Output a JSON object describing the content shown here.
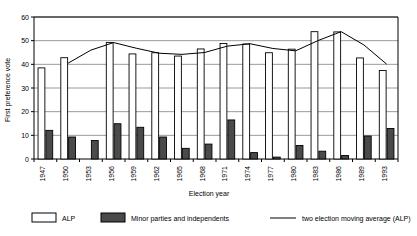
{
  "chart_data": {
    "type": "bar",
    "title": "",
    "xlabel": "Election year",
    "ylabel": "First preference vote",
    "ylim": [
      0,
      60
    ],
    "yticks": [
      0,
      10,
      20,
      30,
      40,
      50,
      60
    ],
    "grid": true,
    "legend_position": "bottom",
    "categories": [
      "1947",
      "1950",
      "1953",
      "1956",
      "1959",
      "1962",
      "1965",
      "1968",
      "1971",
      "1974",
      "1977",
      "1980",
      "1983",
      "1986",
      "1989",
      "1993"
    ],
    "series": [
      {
        "name": "ALP",
        "type": "bar",
        "color": "#ffffff",
        "edge_color": "#000000",
        "values": [
          38.5,
          42.8,
          null,
          49.2,
          44.4,
          44.9,
          43.5,
          46.5,
          48.8,
          48.6,
          44.9,
          46.4,
          53.8,
          53.7,
          42.7,
          37.4
        ]
      },
      {
        "name": "Minor parties and independents",
        "type": "bar",
        "color": "#4a4a4a",
        "edge_color": "#000000",
        "values": [
          12.1,
          9.3,
          7.8,
          14.9,
          13.4,
          9.3,
          4.5,
          6.3,
          16.5,
          2.7,
          0.8,
          5.7,
          3.3,
          1.5,
          9.7,
          12.9
        ]
      },
      {
        "name": "two election moving average (ALP)",
        "type": "line",
        "color": "#000000",
        "values": [
          null,
          40.5,
          46.0,
          49.2,
          46.8,
          44.7,
          44.2,
          45.0,
          47.7,
          48.7,
          46.7,
          45.7,
          50.1,
          53.8,
          48.2,
          40.1
        ]
      }
    ]
  },
  "legend": {
    "items": [
      {
        "label": "ALP",
        "swatch": "bar-white"
      },
      {
        "label": "Minor parties and independents",
        "swatch": "bar-dark"
      },
      {
        "label": "two election moving average (ALP)",
        "swatch": "line"
      }
    ]
  }
}
